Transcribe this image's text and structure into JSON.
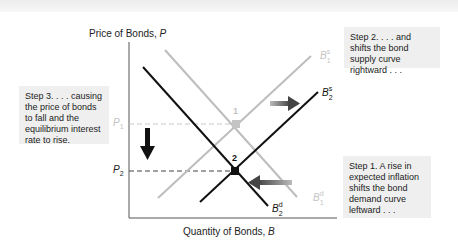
{
  "diagram": {
    "y_axis": {
      "label": "Price of Bonds, ",
      "var": "P"
    },
    "x_axis": {
      "label": "Quantity of Bonds, ",
      "var": "B"
    },
    "price_labels": {
      "p1": "P",
      "p1_sub": "1",
      "p2": "P",
      "p2_sub": "2"
    },
    "points": [
      {
        "label": "1",
        "x": 236,
        "y": 124
      },
      {
        "label": "2",
        "x": 235,
        "y": 171
      }
    ],
    "curves": {
      "bs1": {
        "main": "B",
        "sup": "s",
        "sub": "1",
        "color": "#bdbdbd"
      },
      "bs2": {
        "main": "B",
        "sup": "s",
        "sub": "2",
        "color": "#111111"
      },
      "bd1": {
        "main": "B",
        "sup": "d",
        "sub": "1",
        "color": "#bdbdbd"
      },
      "bd2": {
        "main": "B",
        "sup": "d",
        "sub": "2",
        "color": "#111111"
      }
    },
    "notes": {
      "step1": "Step 1. A rise in expected inflation shifts the bond demand curve leftward . . .",
      "step2": "Step 2.  . . . and shifts the bond supply curve rightward . . .",
      "step3": "Step 3.  . . . causing the price of bonds to fall and the equilibrium interest rate to rise."
    },
    "colors": {
      "old_curve": "#bdbdbd",
      "new_curve": "#111111",
      "shift_arrow": "#555555",
      "note_bg": "#efefef"
    }
  }
}
